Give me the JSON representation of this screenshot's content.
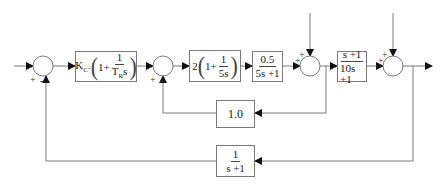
{
  "diagram": {
    "type": "block-diagram",
    "blocks": {
      "controller_outer": {
        "gain": "K",
        "gain_sub": "C",
        "one": "1",
        "plus": "+",
        "num": "1",
        "den_T": "T",
        "den_sub": "R",
        "den_s": "s"
      },
      "controller_inner": {
        "gain": "2",
        "one": "1",
        "plus": "+",
        "num": "1",
        "den": "5s"
      },
      "process_1": {
        "num": "0.5",
        "den": "5s +1"
      },
      "process_2": {
        "num": "s +1",
        "den": "10s +1"
      },
      "inner_feedback": {
        "value": "1.0"
      },
      "outer_feedback": {
        "num": "1",
        "den": "s +1"
      }
    },
    "junctions": {
      "sum1": {
        "sign_in": "+",
        "sign_fb": "-"
      },
      "sum2": {
        "sign_in": "+",
        "sign_fb": "-"
      },
      "sum3": {
        "sign_top": "+",
        "sign_left": "+"
      },
      "sum4": {
        "sign_top": "+",
        "sign_left": "+"
      }
    },
    "line_color": "#7a7a7a",
    "arrow_color": "#111111"
  }
}
